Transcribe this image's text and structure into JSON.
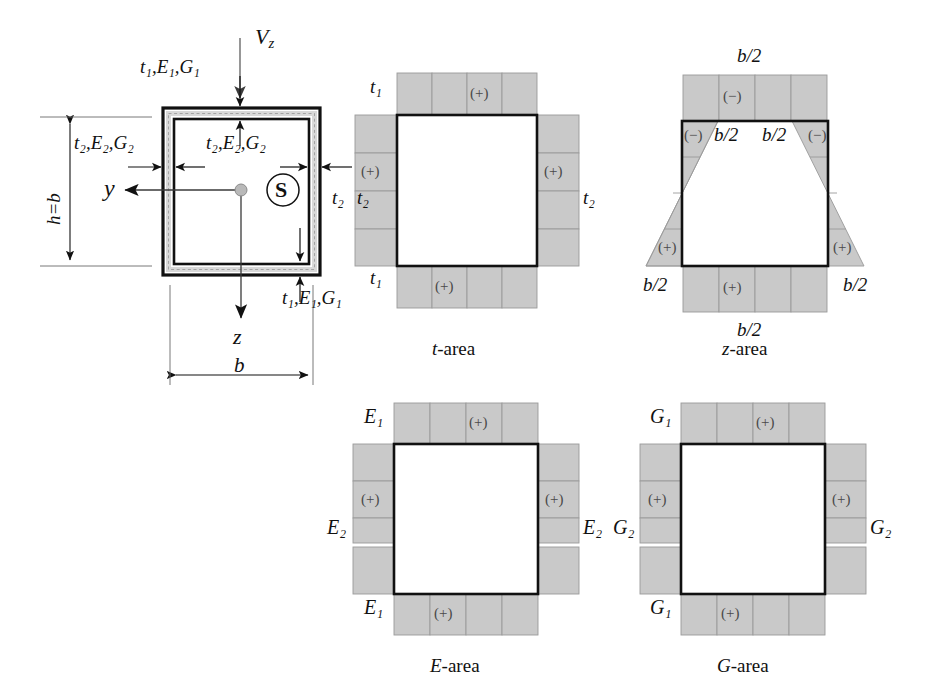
{
  "figure": {
    "title_note": "Thin-walled square box cross-section with shear area distributions",
    "colors": {
      "hatch_gray": "#c9c9c9",
      "line_black": "#111111",
      "sign_gray": "#4a4a4a",
      "centroid_dot": "#b9b9b9"
    }
  },
  "main_section": {
    "load_label": "V",
    "load_sub": "z",
    "top_flange_label": "t",
    "top_flange_rest": ",E",
    "top_flange_rest2": ",G",
    "labels": {
      "flange_top": "t₁,E₁,G₁",
      "flange_bottom": "t₁,E₁,G₁",
      "web_left": "t₂,E₂,G₂",
      "web_right": "t₂,E₂,G₂",
      "thickness_right": "t₂",
      "axis_y": "y",
      "axis_z": "z",
      "shear_center": "S",
      "height_dim": "h=b",
      "width_dim": "b"
    }
  },
  "panels": [
    {
      "id": "t-area",
      "caption_italic": "t",
      "caption_rest": "-area",
      "labels": {
        "top_left": "t₁",
        "bottom_left": "t₁",
        "side_left": "t₂",
        "side_right": "t₂"
      },
      "signs": {
        "top": "(+)",
        "bottom": "(+)",
        "left": "(+)",
        "right": "(+)"
      }
    },
    {
      "id": "z-area",
      "caption_italic": "z",
      "caption_rest": "-area",
      "labels": {
        "top_outer": "b/2",
        "top_inner_left": "b/2",
        "top_inner_right": "b/2",
        "bottom_outer": "b/2",
        "bottom_left": "b/2",
        "bottom_right": "b/2"
      },
      "signs": {
        "top": "(−)",
        "upper_left": "(−)",
        "upper_right": "(−)",
        "lower_left": "(+)",
        "lower_right": "(+)",
        "bottom": "(+)"
      }
    },
    {
      "id": "E-area",
      "caption_italic": "E",
      "caption_rest": "-area",
      "labels": {
        "top_left": "E₁",
        "bottom_left": "E₁",
        "side_left": "E₂",
        "side_right": "E₂"
      },
      "signs": {
        "top": "(+)",
        "bottom": "(+)",
        "left": "(+)",
        "right": "(+)"
      }
    },
    {
      "id": "G-area",
      "caption_italic": "G",
      "caption_rest": "-area",
      "labels": {
        "top_left": "G₁",
        "bottom_left": "G₁",
        "side_left": "G₂",
        "side_right": "G₂"
      },
      "signs": {
        "top": "(+)",
        "bottom": "(+)",
        "left": "(+)",
        "right": "(+)"
      }
    }
  ],
  "text": {
    "t_area_caption_it": "t",
    "t_area_caption_rest": "-area",
    "z_area_caption_it": "z",
    "z_area_caption_rest": "-area",
    "e_area_caption_it": "E",
    "e_area_caption_rest": "-area",
    "g_area_caption_it": "G",
    "g_area_caption_rest": "-area"
  }
}
